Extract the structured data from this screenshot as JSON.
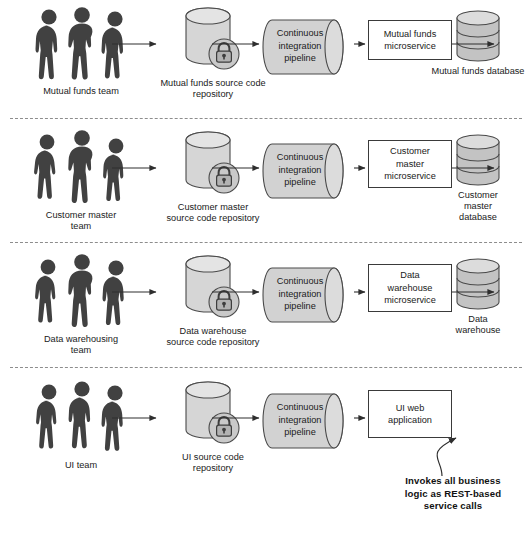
{
  "figure": {
    "caption": "",
    "background_color": "#ffffff",
    "shape_fill": "#d2d2d2",
    "box_fill": "#ffffff",
    "line_color": "#3a3a3a",
    "silhouette_color": "#3f3f3f",
    "divider_style": "dashed"
  },
  "rows": [
    {
      "id": "mutual-funds",
      "team": {
        "label": "Mutual funds team",
        "icon": "people-group-icon",
        "count": 3
      },
      "repository": {
        "label": "Mutual funds\nsource code repository",
        "icon": "locked-repository-icon"
      },
      "pipeline": {
        "label": "Continuous\nintegration\npipeline",
        "icon": "pipeline-cylinder-icon"
      },
      "service": {
        "label": "Mutual funds\nmicroservice",
        "type": "microservice"
      },
      "store": {
        "label": "Mutual funds\ndatabase",
        "icon": "database-icon"
      }
    },
    {
      "id": "customer-master",
      "team": {
        "label": "Customer master\nteam",
        "icon": "people-group-icon",
        "count": 3
      },
      "repository": {
        "label": "Customer master\nsource code repository",
        "icon": "locked-repository-icon"
      },
      "pipeline": {
        "label": "Continuous\nintegration\npipeline",
        "icon": "pipeline-cylinder-icon"
      },
      "service": {
        "label": "Customer\nmaster\nmicroservice",
        "type": "microservice"
      },
      "store": {
        "label": "Customer\nmaster\ndatabase",
        "icon": "database-icon"
      }
    },
    {
      "id": "data-warehousing",
      "team": {
        "label": "Data warehousing\nteam",
        "icon": "people-group-icon",
        "count": 3
      },
      "repository": {
        "label": "Data warehouse\nsource code repository",
        "icon": "locked-repository-icon"
      },
      "pipeline": {
        "label": "Continuous\nintegration\npipeline",
        "icon": "pipeline-cylinder-icon"
      },
      "service": {
        "label": "Data\nwarehouse\nmicroservice",
        "type": "microservice"
      },
      "store": {
        "label": "Data\nwarehouse",
        "icon": "database-icon"
      }
    },
    {
      "id": "ui",
      "team": {
        "label": "UI team",
        "icon": "people-group-icon",
        "count": 3
      },
      "repository": {
        "label": "UI source code\nrepository",
        "icon": "locked-repository-icon"
      },
      "pipeline": {
        "label": "Continuous\nintegration\npipeline",
        "icon": "pipeline-cylinder-icon"
      },
      "service": {
        "label": "UI web\napplication",
        "type": "web-application"
      },
      "store": null
    }
  ],
  "annotation": {
    "text": "Invokes all business\nlogic as REST-based\nservice calls",
    "points_to": "ui-web-application",
    "style": "bold-callout-with-curved-leader"
  }
}
